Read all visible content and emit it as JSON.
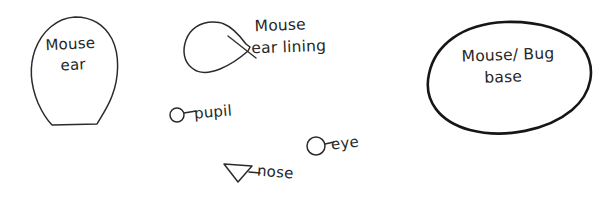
{
  "canvas": {
    "title": "Mouse part sketch reference",
    "background_color": "#ffffff",
    "ink_color": "#2b2b2b",
    "bold_ink_color": "#161616",
    "width": 614,
    "height": 199
  },
  "shapes": [
    {
      "name": "mouse-ear",
      "label_line1": "Mouse",
      "label_line2": "ear",
      "description": "rounded dome narrowing to flat base"
    },
    {
      "name": "mouse-ear-lining",
      "label_line1": "Mouse",
      "label_line2": "ear lining",
      "description": "teardrop blob with pointed right tip crossed by leader line"
    },
    {
      "name": "mouse-bug-base",
      "label_line1": "Mouse/ Bug",
      "label_line2": "base",
      "description": "large egg shaped oval, heavy stroke"
    }
  ],
  "parts": [
    {
      "name": "pupil",
      "label": "pupil",
      "marker": "small-circle"
    },
    {
      "name": "eye",
      "label": "eye",
      "marker": "circle"
    },
    {
      "name": "nose",
      "label": "nose",
      "marker": "triangle"
    }
  ]
}
